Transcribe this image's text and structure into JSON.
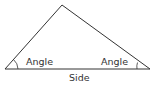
{
  "diagram": {
    "shape": "triangle",
    "stroke_color": "#333333",
    "background": "#ffffff",
    "vertices": {
      "apex": [
        62,
        5
      ],
      "base_left": [
        5,
        69
      ],
      "base_right": [
        150,
        69
      ]
    },
    "labels": {
      "left_angle": "Angle",
      "right_angle": "Angle",
      "base_side": "Side"
    }
  }
}
